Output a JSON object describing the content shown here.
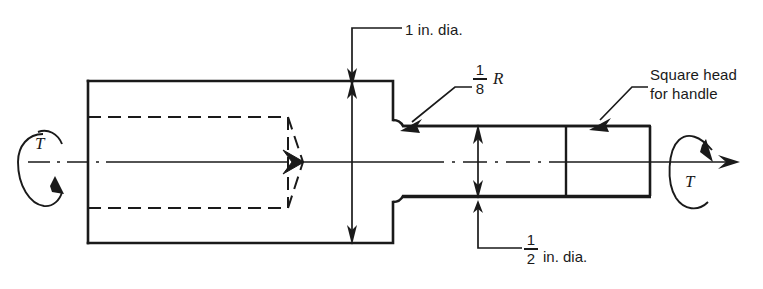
{
  "figure": {
    "type": "engineering-drawing",
    "background_color": "#ffffff",
    "line_color": "#1a1a1a"
  },
  "annotations": {
    "top_dimension": {
      "text": "1 in. dia.",
      "name": "one-inch-diameter-label"
    },
    "fillet_radius": {
      "numerator": "1",
      "denominator": "8",
      "suffix": "R",
      "name": "fillet-radius-label"
    },
    "square_head": {
      "line1": "Square head",
      "line2": "for handle",
      "name": "square-head-label"
    },
    "bottom_dimension": {
      "numerator": "1",
      "denominator": "2",
      "suffix": "in. dia.",
      "name": "half-inch-diameter-label"
    },
    "torque_left": {
      "symbol": "T",
      "direction": "counterclockwise"
    },
    "torque_right": {
      "symbol": "T",
      "direction": "clockwise"
    }
  },
  "geometry": {
    "body": {
      "x1": 88,
      "y1": 81,
      "x2": 393,
      "y2": 243
    },
    "bore_dashed": {
      "x1": 88,
      "y1": 117,
      "x2": 285,
      "y2": 208
    },
    "cone_apex_x": 302,
    "shaft": {
      "x1": 393,
      "y1": 120,
      "x2": 650,
      "y2": 202
    },
    "square_head_divider_x": 566,
    "axis_y": 162
  }
}
